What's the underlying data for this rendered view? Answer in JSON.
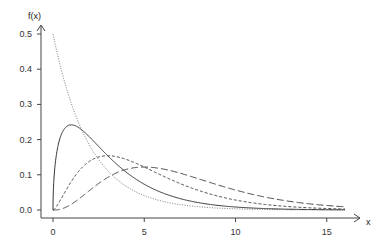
{
  "chart_data": {
    "type": "line",
    "title": "",
    "xlabel": "x",
    "ylabel": "f(x)",
    "xlim": [
      0,
      16
    ],
    "ylim": [
      0,
      0.5
    ],
    "x_ticks": [
      0,
      5,
      10,
      15
    ],
    "x_tick_labels": [
      "0",
      "5",
      "10",
      "15"
    ],
    "y_ticks": [
      0.0,
      0.1,
      0.2,
      0.3,
      0.4,
      0.5
    ],
    "y_tick_labels": [
      "0.0",
      "0.1",
      "0.2",
      "0.3",
      "0.4",
      "0.5"
    ],
    "grid": false,
    "legend": null,
    "series": [
      {
        "name": "df=2",
        "linestyle": "dotted",
        "color": "#555555",
        "df": 2,
        "peak_x": 0,
        "peak_y": 0.5,
        "x": [
          0,
          1,
          2,
          3,
          4,
          5,
          6,
          8,
          10,
          12,
          14,
          16
        ],
        "values": [
          0.5,
          0.303,
          0.184,
          0.112,
          0.068,
          0.041,
          0.025,
          0.009,
          0.003,
          0.001,
          0.0005,
          0.0002
        ]
      },
      {
        "name": "df=3",
        "linestyle": "solid",
        "color": "#333333",
        "df": 3,
        "peak_x": 1,
        "peak_y": 0.242,
        "x": [
          0,
          1,
          2,
          3,
          4,
          5,
          6,
          8,
          10,
          12,
          14,
          16
        ],
        "values": [
          0.0,
          0.242,
          0.208,
          0.154,
          0.108,
          0.073,
          0.048,
          0.021,
          0.008,
          0.003,
          0.001,
          0.0005
        ]
      },
      {
        "name": "df=5",
        "linestyle": "short-dashed",
        "color": "#444444",
        "df": 5,
        "peak_x": 3,
        "peak_y": 0.154,
        "x": [
          0,
          1,
          2,
          3,
          4,
          5,
          6,
          8,
          10,
          12,
          14,
          16
        ],
        "values": [
          0.0,
          0.081,
          0.138,
          0.154,
          0.144,
          0.122,
          0.097,
          0.055,
          0.028,
          0.013,
          0.006,
          0.003
        ]
      },
      {
        "name": "df=7",
        "linestyle": "long-dashed",
        "color": "#444444",
        "df": 7,
        "peak_x": 5,
        "peak_y": 0.122,
        "x": [
          0,
          1,
          2,
          3,
          4,
          5,
          6,
          8,
          10,
          12,
          14,
          16
        ],
        "values": [
          0.0,
          0.013,
          0.052,
          0.092,
          0.116,
          0.122,
          0.115,
          0.085,
          0.053,
          0.03,
          0.016,
          0.008
        ]
      }
    ]
  },
  "layout": {
    "x_px": {
      "min": 53,
      "max": 345,
      "range": [
        0,
        16
      ]
    },
    "y_px": {
      "min": 210,
      "max": 34,
      "range": [
        0,
        0.5
      ]
    }
  }
}
